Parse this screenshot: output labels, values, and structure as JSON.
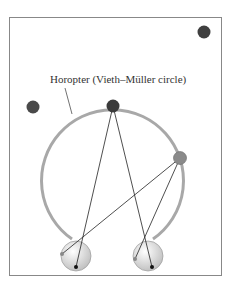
{
  "diagram": {
    "label": "Horopter (Vieth–Müller circle)",
    "colors": {
      "frame": "#888888",
      "horopter": "#a8a8a8",
      "fixation_point": "#3a3a3a",
      "outside_point": "#4a4a4a",
      "on_circle_point": "#8a8a8a",
      "eye_fill": "#e6e6e6",
      "lines": "#222222"
    }
  }
}
